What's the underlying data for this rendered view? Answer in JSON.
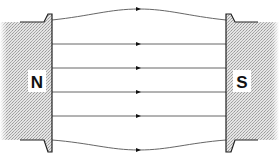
{
  "diagram": {
    "poles": {
      "north": {
        "label": "N"
      },
      "south": {
        "label": "S"
      }
    },
    "field_lines": {
      "count": 6,
      "direction": "north-to-south",
      "arrow_marker": "triangle-right"
    },
    "colors": {
      "line": "#555555",
      "pole_fill": "#d6d6d6",
      "pole_outline": "#222222",
      "label_bg": "#ffffff",
      "label_text": "#111111"
    }
  }
}
